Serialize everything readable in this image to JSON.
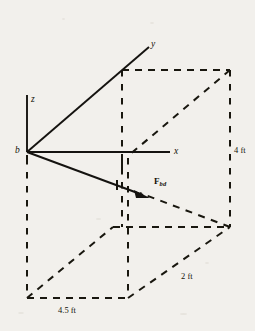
{
  "figure": {
    "kind": "engineering-statics-diagram",
    "background_color": "#f2f0ec",
    "ink_color": "#151310"
  },
  "axes": {
    "origin_label": "b",
    "x_label": "x",
    "y_label": "y",
    "z_label": "z"
  },
  "force": {
    "symbol": "F",
    "subscript": "bd",
    "label": "F"
  },
  "dimensions": [
    {
      "name": "height",
      "label": "4 ft",
      "value": 4,
      "unit": "ft"
    },
    {
      "name": "depth",
      "label": "2 ft",
      "value": 2,
      "unit": "ft"
    },
    {
      "name": "width",
      "label": "4.5 ft",
      "value": 4.5,
      "unit": "ft"
    }
  ],
  "dimension_labels": {
    "height": "4 ft",
    "depth": "2 ft",
    "width": "4.5 ft"
  }
}
